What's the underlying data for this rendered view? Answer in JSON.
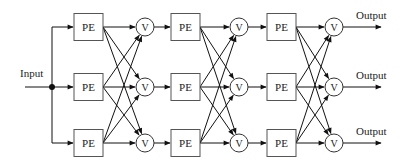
{
  "diagram": {
    "input_label": "Input",
    "pe_label": "PE",
    "v_label": "V",
    "output_label": "Output",
    "rows_y": [
      27,
      87,
      143
    ],
    "stages": [
      {
        "pe_x": 74,
        "v_cx": 145
      },
      {
        "pe_x": 171,
        "v_cx": 239
      },
      {
        "pe_x": 267,
        "v_cx": 334
      }
    ],
    "pe_size": {
      "w": 29,
      "h": 27
    },
    "v_radius": 9,
    "input": {
      "x_start": 25,
      "junction_x": 52,
      "text_x": 20,
      "text_y": 77
    },
    "output": {
      "x_end": 381,
      "text_x": 356
    },
    "colors": {
      "stroke": "#111111",
      "box_stroke": "#555555",
      "background": "#ffffff"
    }
  }
}
